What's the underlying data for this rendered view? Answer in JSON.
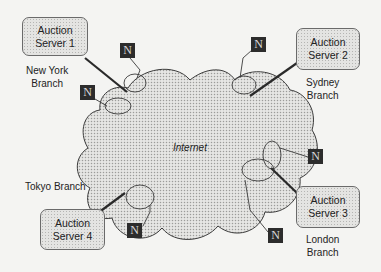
{
  "cloud": {
    "label": "Internet",
    "fill_color": "#d8d8d6",
    "stroke_color": "#3a3a3a"
  },
  "servers": [
    {
      "id": 1,
      "line1": "Auction",
      "line2": "Server 1",
      "branch_line1": "New York",
      "branch_line2": "Branch"
    },
    {
      "id": 2,
      "line1": "Auction",
      "line2": "Server 2",
      "branch_line1": "Sydney",
      "branch_line2": "Branch"
    },
    {
      "id": 3,
      "line1": "Auction",
      "line2": "Server 3",
      "branch_line1": "London",
      "branch_line2": "Branch"
    },
    {
      "id": 4,
      "line1": "Auction",
      "line2": "Server 4",
      "branch_line1": "Tokyo Branch",
      "branch_line2": ""
    }
  ],
  "nodes": [
    {
      "label": "N"
    },
    {
      "label": "N"
    },
    {
      "label": "N"
    },
    {
      "label": "N"
    },
    {
      "label": "N"
    },
    {
      "label": "N"
    }
  ]
}
